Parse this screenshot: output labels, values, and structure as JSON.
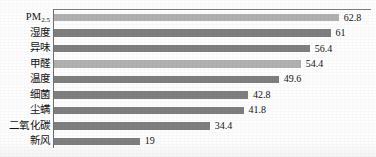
{
  "chart_data": {
    "type": "bar",
    "orientation": "horizontal",
    "title": "",
    "subtitle": "",
    "xlabel": "",
    "ylabel": "",
    "xlim": [
      0,
      70
    ],
    "grid": false,
    "legend": false,
    "legend_position": "none",
    "axis_line": "left-and-top",
    "value_labels_shown": true,
    "categories": [
      "PM2.5",
      "湿度",
      "异味",
      "甲醛",
      "温度",
      "细菌",
      "尘螨",
      "二氧化碳",
      "新风"
    ],
    "values": [
      62.8,
      61,
      56.4,
      54.4,
      49.6,
      42.8,
      41.8,
      34.4,
      19
    ],
    "value_labels": [
      "62.8",
      "61",
      "56.4",
      "54.4",
      "49.6",
      "42.8",
      "41.8",
      "34.4",
      "19"
    ],
    "bar_colors": [
      "#b0b0b0",
      "#7f7f7f",
      "#7f7f7f",
      "#b0b0b0",
      "#7f7f7f",
      "#7f7f7f",
      "#7f7f7f",
      "#7f7f7f",
      "#7f7f7f"
    ]
  },
  "bars": [
    {
      "label_main": "PM",
      "label_sub": "2.5",
      "value": "62.8",
      "shade": "light"
    },
    {
      "label_main": "湿度",
      "label_sub": "",
      "value": "61",
      "shade": "dark"
    },
    {
      "label_main": "异味",
      "label_sub": "",
      "value": "56.4",
      "shade": "dark"
    },
    {
      "label_main": "甲醛",
      "label_sub": "",
      "value": "54.4",
      "shade": "light"
    },
    {
      "label_main": "温度",
      "label_sub": "",
      "value": "49.6",
      "shade": "dark"
    },
    {
      "label_main": "细菌",
      "label_sub": "",
      "value": "42.8",
      "shade": "dark"
    },
    {
      "label_main": "尘螨",
      "label_sub": "",
      "value": "41.8",
      "shade": "dark"
    },
    {
      "label_main": "二氧化碳",
      "label_sub": "",
      "value": "34.4",
      "shade": "dark"
    },
    {
      "label_main": "新风",
      "label_sub": "",
      "value": "19",
      "shade": "dark"
    }
  ]
}
